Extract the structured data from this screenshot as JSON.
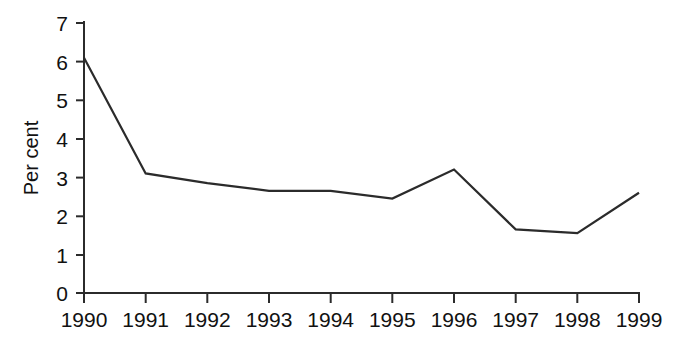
{
  "chart_data": {
    "type": "line",
    "title": "",
    "subtitle": "",
    "xlabel": "",
    "ylabel": "Per cent",
    "categories": [
      "1990",
      "1991",
      "1992",
      "1993",
      "1994",
      "1995",
      "1996",
      "1997",
      "1998",
      "1999"
    ],
    "x": [
      1990,
      1991,
      1992,
      1993,
      1994,
      1995,
      1996,
      1997,
      1998,
      1999
    ],
    "values": [
      6.1,
      3.1,
      2.85,
      2.65,
      2.65,
      2.45,
      3.2,
      1.65,
      1.55,
      2.6
    ],
    "series": [
      {
        "name": "Per cent",
        "values": [
          6.1,
          3.1,
          2.85,
          2.65,
          2.65,
          2.45,
          3.2,
          1.65,
          1.55,
          2.6
        ],
        "color": "#2b2b2b"
      }
    ],
    "ylim": [
      0,
      7
    ],
    "yticks": [
      0,
      1,
      2,
      3,
      4,
      5,
      6,
      7
    ],
    "ytick_labels": [
      "0",
      "1",
      "2",
      "3",
      "4",
      "5",
      "6",
      "7"
    ],
    "xtick_labels": [
      "1990",
      "1991",
      "1992",
      "1993",
      "1994",
      "1995",
      "1996",
      "1997",
      "1998",
      "1999"
    ],
    "grid": false,
    "legend": false,
    "legend_position": "none",
    "line_color": "#2b2b2b",
    "axis_color": "#2b2b2b",
    "background_color": "#ffffff",
    "markers": false,
    "annotations": []
  }
}
